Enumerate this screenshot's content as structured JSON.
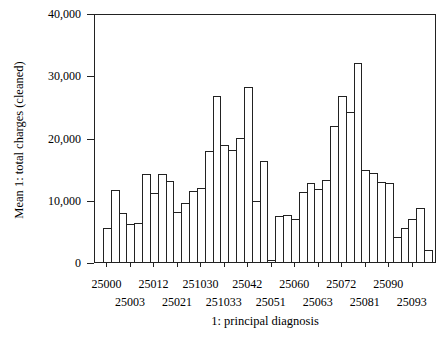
{
  "chart_data": {
    "type": "bar",
    "title": "",
    "xlabel": "1: principal diagnosis",
    "ylabel": "Mean 1: total charges (cleaned)",
    "ylim": [
      0,
      40000
    ],
    "yticks": [
      0,
      10000,
      20000,
      30000,
      40000
    ],
    "ytick_labels": [
      "0",
      "10,000",
      "20,000",
      "30,000",
      "40,000"
    ],
    "grid": false,
    "legend": null,
    "x_tick_labels_row1": [
      "25000",
      "25012",
      "251030",
      "25042",
      "25060",
      "25072",
      "25090"
    ],
    "x_tick_labels_row2": [
      "25003",
      "25021",
      "251033",
      "25051",
      "25063",
      "25081",
      "25093"
    ],
    "x_tick_labels": [
      "25000",
      "25003",
      "25012",
      "25021",
      "251030",
      "251033",
      "25042",
      "25051",
      "25060",
      "25063",
      "25072",
      "25081",
      "25090",
      "25093"
    ],
    "x_tick_every_n_bars": 3,
    "bar_count": 42,
    "values": [
      5400,
      11600,
      7800,
      6100,
      6300,
      14200,
      11100,
      14200,
      13000,
      8000,
      9500,
      11400,
      11900,
      17800,
      26700,
      18800,
      18000,
      19900,
      28100,
      9800,
      16200,
      400,
      7400,
      7500,
      6900,
      11200,
      12700,
      11700,
      13200,
      21900,
      26600,
      24100,
      32000,
      14800,
      14300,
      12800,
      12700,
      4000,
      5500,
      6900,
      8600,
      1900
    ]
  },
  "ui": {
    "bar_fill": "#ffffff",
    "bar_stroke": "#222222"
  }
}
